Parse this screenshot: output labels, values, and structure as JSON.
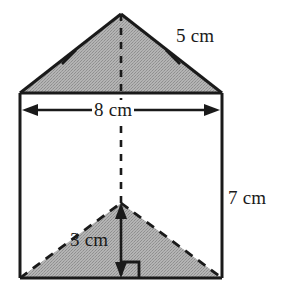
{
  "figure": {
    "shape_name": "triangular-prism",
    "fill_color": "#a9a9a9",
    "stroke_color": "#1a1a1a",
    "background_color": "#ffffff"
  },
  "labels": {
    "slant_side": "5 cm",
    "base_width": "8 cm",
    "prism_height": "7 cm",
    "triangle_height": "3 cm"
  },
  "measurements": [
    {
      "name": "slant-side",
      "value": 5,
      "unit": "cm",
      "text": "5 cm"
    },
    {
      "name": "base-width",
      "value": 8,
      "unit": "cm",
      "text": "8 cm"
    },
    {
      "name": "prism-height",
      "value": 7,
      "unit": "cm",
      "text": "7 cm"
    },
    {
      "name": "triangle-height",
      "value": 3,
      "unit": "cm",
      "text": "3 cm"
    }
  ],
  "annotations": {
    "congruence_ticks": 2,
    "right_angle_marker": true,
    "dashed_center_line": true,
    "hidden_edges_dashed": true
  },
  "geometry": {
    "rect_left": 20,
    "rect_right": 222,
    "rect_top": 93,
    "rect_bottom": 278,
    "top_apex_x": 121,
    "top_apex_y": 14,
    "back_apex_x": 121,
    "back_apex_y": 203
  }
}
